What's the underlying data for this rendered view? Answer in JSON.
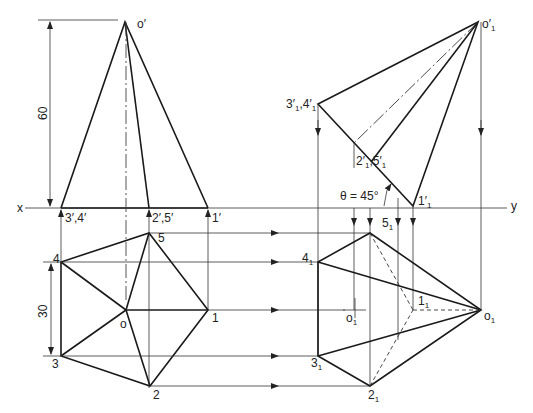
{
  "figure": {
    "reference_line": {
      "left_label": "x",
      "right_label": "y"
    },
    "dimensions": {
      "height": "60",
      "side": "30"
    },
    "angle_label": "θ = 45°",
    "front_view": {
      "apex": "o′",
      "base_points": [
        "3′,4′",
        "2′,5′",
        "1′"
      ]
    },
    "top_view": {
      "center": "o",
      "corners": [
        "1",
        "2",
        "3",
        "4",
        "5"
      ]
    },
    "aux_front_view": {
      "apex": "o′",
      "apex_sub": "1",
      "points": [
        {
          "main": "3′",
          "sub": "1",
          "extra": ",4′",
          "extra_sub": "1"
        },
        {
          "main": "2′",
          "sub": "1",
          "extra": ",5′",
          "extra_sub": "1"
        },
        {
          "main": "1′",
          "sub": "1"
        }
      ]
    },
    "aux_top_view": {
      "apex": {
        "main": "o",
        "sub": "1"
      },
      "axis_center": {
        "main": "o",
        "sub": "1"
      },
      "corners": [
        {
          "main": "1",
          "sub": "1"
        },
        {
          "main": "2",
          "sub": "1"
        },
        {
          "main": "3",
          "sub": "1"
        },
        {
          "main": "4",
          "sub": "1"
        },
        {
          "main": "5",
          "sub": "1"
        }
      ]
    }
  },
  "colors": {
    "line": "#1a1a1a",
    "background": "#ffffff"
  }
}
